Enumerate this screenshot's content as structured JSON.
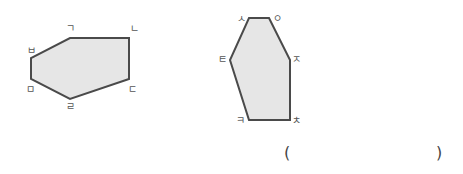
{
  "shapes": [
    {
      "id": "hexagon-left",
      "fill": "#e6e6e6",
      "stroke": "#4a4a4a",
      "vertices": [
        {
          "label": "ㄱ",
          "x": 70,
          "y": 38,
          "lx": 66,
          "ly": 32
        },
        {
          "label": "ㄴ",
          "x": 129,
          "y": 38,
          "lx": 130,
          "ly": 32
        },
        {
          "label": "ㄷ",
          "x": 129,
          "y": 79,
          "lx": 128,
          "ly": 93
        },
        {
          "label": "ㄹ",
          "x": 70,
          "y": 99,
          "lx": 66,
          "ly": 110
        },
        {
          "label": "ㅁ",
          "x": 31,
          "y": 79,
          "lx": 26,
          "ly": 93
        },
        {
          "label": "ㅂ",
          "x": 31,
          "y": 58,
          "lx": 27,
          "ly": 54
        }
      ]
    },
    {
      "id": "hexagon-right",
      "fill": "#e6e6e6",
      "stroke": "#4a4a4a",
      "vertices": [
        {
          "label": "ㅅ",
          "x": 249,
          "y": 18,
          "lx": 237,
          "ly": 22
        },
        {
          "label": "ㅇ",
          "x": 269,
          "y": 18,
          "lx": 273,
          "ly": 22
        },
        {
          "label": "ㅈ",
          "x": 290,
          "y": 60,
          "lx": 292,
          "ly": 63
        },
        {
          "label": "ㅊ",
          "x": 290,
          "y": 120,
          "lx": 292,
          "ly": 124
        },
        {
          "label": "ㅋ",
          "x": 249,
          "y": 120,
          "lx": 236,
          "ly": 124
        },
        {
          "label": "ㅌ",
          "x": 230,
          "y": 60,
          "lx": 218,
          "ly": 63
        }
      ]
    }
  ],
  "answer_box": {
    "open_paren": "(",
    "close_paren": ")",
    "value": ""
  }
}
